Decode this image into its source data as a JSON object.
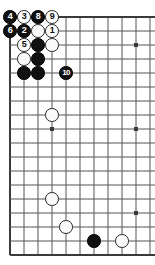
{
  "diagram": {
    "kind": "go-board-diagram",
    "title": "",
    "board": {
      "cols": 11,
      "rows": 18,
      "cell": 14,
      "origin_x": 10,
      "origin_y": 17,
      "line_color": "#555555",
      "edge_color": "#3a3a3a",
      "background": "#ffffff",
      "top_edge_visible": true,
      "left_edge_visible": true,
      "bottom_edge_visible": true,
      "right_edge_visible": false
    },
    "star_points": [
      {
        "col": 9,
        "row": 2
      },
      {
        "col": 3,
        "row": 8
      },
      {
        "col": 9,
        "row": 8
      },
      {
        "col": 9,
        "row": 14
      }
    ],
    "colors": {
      "black_stone": "#111111",
      "white_stone": "#fbfbfb",
      "white_stone_border": "#242424",
      "black_label": "#ffffff",
      "white_label": "#111111"
    },
    "stones": [
      {
        "col": 0,
        "row": 0,
        "color": "black",
        "label": "4"
      },
      {
        "col": 1,
        "row": 0,
        "color": "white",
        "label": "3"
      },
      {
        "col": 2,
        "row": 0,
        "color": "black",
        "label": "8"
      },
      {
        "col": 3,
        "row": 0,
        "color": "white",
        "label": "9"
      },
      {
        "col": 0,
        "row": 1,
        "color": "black",
        "label": "6"
      },
      {
        "col": 1,
        "row": 1,
        "color": "black",
        "label": "2"
      },
      {
        "col": 2,
        "row": 1,
        "color": "white",
        "label": ""
      },
      {
        "col": 3,
        "row": 1,
        "color": "white",
        "label": "1"
      },
      {
        "col": 1,
        "row": 2,
        "color": "white",
        "label": "5"
      },
      {
        "col": 2,
        "row": 2,
        "color": "black",
        "label": ""
      },
      {
        "col": 3,
        "row": 2,
        "color": "white",
        "label": ""
      },
      {
        "col": 1,
        "row": 3,
        "color": "white",
        "label": ""
      },
      {
        "col": 2,
        "row": 3,
        "color": "black",
        "label": ""
      },
      {
        "col": 1,
        "row": 4,
        "color": "black",
        "label": ""
      },
      {
        "col": 2,
        "row": 4,
        "color": "black",
        "label": ""
      },
      {
        "col": 4,
        "row": 4,
        "color": "black",
        "label": "10"
      },
      {
        "col": 3,
        "row": 7,
        "color": "white",
        "label": ""
      },
      {
        "col": 3,
        "row": 13,
        "color": "white",
        "label": ""
      },
      {
        "col": 4,
        "row": 15,
        "color": "white",
        "label": ""
      },
      {
        "col": 6,
        "row": 16,
        "color": "black",
        "label": ""
      },
      {
        "col": 8,
        "row": 16,
        "color": "white",
        "label": ""
      }
    ]
  }
}
